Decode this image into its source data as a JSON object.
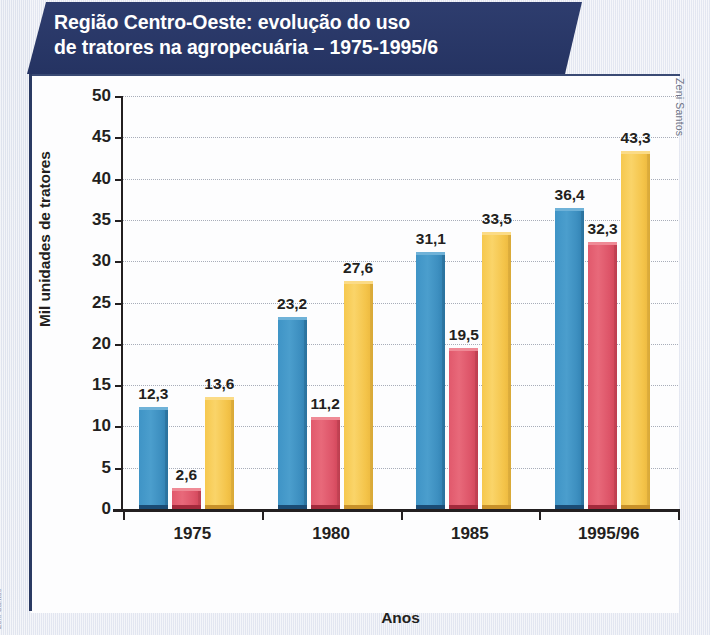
{
  "title": "Região Centro-Oeste: evolução do uso\nde tratores na agropecuária – 1975-1995/6",
  "credit": "Zeni Santos",
  "margin_credit": "Zeni Santos",
  "chart_data": {
    "type": "bar",
    "title": "Região Centro-Oeste: evolução do uso de tratores na agropecuária – 1975-1995/6",
    "xlabel": "Anos",
    "ylabel": "Mil unidades de tratores",
    "categories": [
      "1975",
      "1980",
      "1985",
      "1995/96"
    ],
    "ylim": [
      0,
      50
    ],
    "yticks": [
      "0",
      "5",
      "10",
      "15",
      "20",
      "25",
      "30",
      "35",
      "40",
      "45",
      "50"
    ],
    "ytick_values": [
      0,
      5,
      10,
      15,
      20,
      25,
      30,
      35,
      40,
      45,
      50
    ],
    "grid": true,
    "legend_position": "bottom",
    "series": [
      {
        "name": "Mato Grosso do Sul",
        "color": "#3f94c6",
        "swatch": "blue",
        "values": [
          12.3,
          23.2,
          31.1,
          36.4
        ],
        "labels": [
          "12,3",
          "23,2",
          "31,1",
          "36,4"
        ]
      },
      {
        "name": "Mato Grosso",
        "color": "#e1596c",
        "swatch": "red",
        "values": [
          2.6,
          11.2,
          19.5,
          32.3
        ],
        "labels": [
          "2,6",
          "11,2",
          "19,5",
          "32,3"
        ]
      },
      {
        "name": "Goiás",
        "color": "#f6c84e",
        "swatch": "yellow",
        "values": [
          13.6,
          27.6,
          33.5,
          43.3
        ],
        "labels": [
          "13,6",
          "27,6",
          "33,5",
          "43,3"
        ]
      }
    ]
  },
  "colors": {
    "banner": "#27376a",
    "blue": "#3f94c6",
    "red": "#e1596c",
    "yellow": "#f6c84e",
    "axis": "#231f20",
    "grid": "#9aa0ad"
  }
}
